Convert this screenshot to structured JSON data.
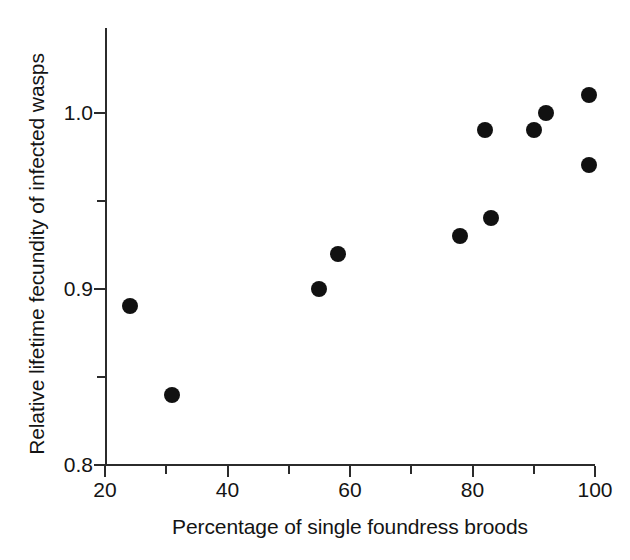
{
  "chart_data": {
    "type": "scatter",
    "title": "",
    "xlabel": "Percentage of single foundress broods",
    "ylabel": "Relative lifetime fecundity of infected wasps",
    "xlim": [
      20,
      100
    ],
    "ylim": [
      0.8,
      1.048
    ],
    "grid": false,
    "legend": null,
    "marker": {
      "shape": "circle",
      "color": "#111111",
      "size_px": 16,
      "filled": true
    },
    "axis_color": "#2b2b2b",
    "background_color": "#ffffff",
    "x_ticks_major": [
      20,
      40,
      60,
      80,
      100
    ],
    "x_ticks_minor": [
      30,
      50,
      70,
      90
    ],
    "x_tick_labels": [
      "20",
      "40",
      "60",
      "80",
      "100"
    ],
    "y_ticks_major": [
      0.8,
      0.9,
      1.0
    ],
    "y_ticks_minor": [
      0.85,
      0.95
    ],
    "y_tick_labels": [
      "0.8",
      "0.9",
      "1.0"
    ],
    "x": [
      24,
      31,
      55,
      58,
      78,
      82,
      83,
      90,
      92,
      99,
      99
    ],
    "y": [
      0.89,
      0.84,
      0.9,
      0.92,
      0.93,
      0.99,
      0.94,
      0.99,
      1.0,
      1.01,
      0.97
    ],
    "points": [
      {
        "x": 24,
        "y": 0.89
      },
      {
        "x": 31,
        "y": 0.84
      },
      {
        "x": 55,
        "y": 0.9
      },
      {
        "x": 58,
        "y": 0.92
      },
      {
        "x": 78,
        "y": 0.93
      },
      {
        "x": 82,
        "y": 0.99
      },
      {
        "x": 83,
        "y": 0.94
      },
      {
        "x": 90,
        "y": 0.99
      },
      {
        "x": 92,
        "y": 1.0
      },
      {
        "x": 99,
        "y": 1.01
      },
      {
        "x": 99,
        "y": 0.97
      }
    ],
    "n_points": 11
  }
}
